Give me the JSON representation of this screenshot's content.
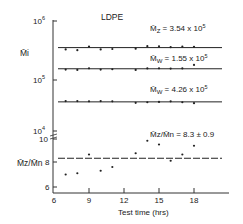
{
  "chart_data": [
    {
      "type": "scatter",
      "title": "LDPE",
      "ylabel": "M̄i",
      "yscale": "log",
      "ylim": [
        40000,
        1000000
      ],
      "ytick_labels": [
        {
          "base": "10",
          "exp": "6",
          "value": 1000000
        },
        {
          "base": "10",
          "exp": "5",
          "value": 100000
        },
        {
          "base": "10",
          "exp": "4",
          "value": 10000
        }
      ],
      "x": [
        7,
        8,
        9,
        10,
        11,
        13,
        14,
        15,
        16,
        17,
        18
      ],
      "series": [
        {
          "name": "Mz",
          "label_main": "M̄",
          "label_sub": "Z",
          "label_value": " = 3.54 x 10",
          "label_exp": "5",
          "mean": 354000,
          "values": [
            330000,
            320000,
            370000,
            330000,
            335000,
            340000,
            375000,
            372000,
            360000,
            368000,
            365000
          ]
        },
        {
          "name": "Mw_upper",
          "label_main": "M̄",
          "label_sub": "W",
          "label_value": " = 1.55 x 10",
          "label_exp": "5",
          "mean": 155000,
          "values": [
            150000,
            148000,
            158000,
            150000,
            152000,
            148000,
            157000,
            158000,
            156000,
            157000,
            180000
          ]
        },
        {
          "name": "Mw_lower",
          "label_main": "M̄",
          "label_sub": "W",
          "label_value": " = 4.26 x 10",
          "label_exp": "5",
          "mean": 42600,
          "values": [
            44000,
            44000,
            43500,
            44000,
            43500,
            41000,
            42000,
            42500,
            43500,
            42000,
            40500
          ]
        }
      ]
    },
    {
      "type": "scatter",
      "ylabel": "M̄z/M̄n",
      "xlabel": "Test time (hrs)",
      "xlim": [
        6,
        21
      ],
      "xticks": [
        6,
        9,
        12,
        15,
        18
      ],
      "ylim": [
        5.8,
        10
      ],
      "yticks": [
        6,
        8,
        10
      ],
      "x": [
        7,
        8,
        9,
        10,
        11,
        13,
        14,
        15,
        16,
        17,
        18
      ],
      "series": [
        {
          "name": "Mz/Mn",
          "label_text": "M̄z/M̄n = 8.3 ± 0.9",
          "mean": 8.3,
          "values": [
            7.0,
            7.1,
            8.6,
            7.3,
            7.6,
            8.7,
            9.7,
            9.4,
            8.1,
            8.6,
            9.3
          ]
        }
      ]
    }
  ]
}
